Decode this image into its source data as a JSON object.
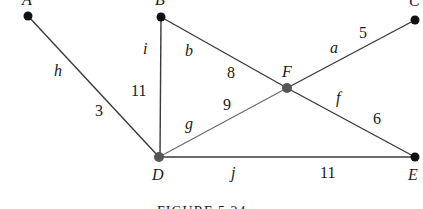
{
  "figure": {
    "caption": "FIGURE 5.24"
  },
  "vertices": {
    "A": {
      "label": "A",
      "x": 28,
      "y": 16,
      "style": "black"
    },
    "B": {
      "label": "B",
      "x": 161,
      "y": 17,
      "style": "black"
    },
    "C": {
      "label": "C",
      "x": 415,
      "y": 20,
      "style": "black"
    },
    "D": {
      "label": "D",
      "x": 159,
      "y": 157,
      "style": "grey"
    },
    "E": {
      "label": "E",
      "x": 415,
      "y": 157,
      "style": "black"
    },
    "F": {
      "label": "F",
      "x": 287,
      "y": 88,
      "style": "grey"
    }
  },
  "edges": {
    "h": {
      "name": "h",
      "from": "A",
      "to": "D",
      "weight": "3"
    },
    "i": {
      "name": "i",
      "from": "B",
      "to": "D",
      "weight": "11"
    },
    "b": {
      "name": "b",
      "from": "B",
      "to": "F",
      "weight": "8"
    },
    "g": {
      "name": "g",
      "from": "D",
      "to": "F",
      "weight": "9"
    },
    "a": {
      "name": "a",
      "from": "F",
      "to": "C",
      "weight": "5"
    },
    "f": {
      "name": "f",
      "from": "F",
      "to": "E",
      "weight": "6"
    },
    "j": {
      "name": "j",
      "from": "D",
      "to": "E",
      "weight": "11"
    }
  }
}
